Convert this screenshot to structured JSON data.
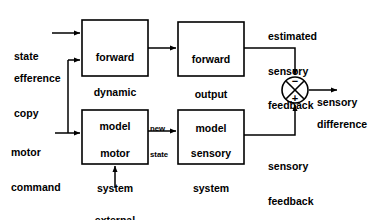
{
  "diagram": {
    "colors": {
      "line": "#000000",
      "text": "#000000",
      "background": "#ffffff"
    },
    "boxes": [
      {
        "id": "forward-dynamic-model",
        "lines": [
          "forward",
          "dynamic",
          "model"
        ],
        "x": 82,
        "y": 20,
        "w": 66,
        "h": 56
      },
      {
        "id": "forward-output-model",
        "lines": [
          "forward",
          "output",
          "model"
        ],
        "x": 178,
        "y": 22,
        "w": 66,
        "h": 54
      },
      {
        "id": "motor-system",
        "lines": [
          "motor",
          "system"
        ],
        "x": 82,
        "y": 110,
        "w": 66,
        "h": 54
      },
      {
        "id": "sensory-system",
        "lines": [
          "sensory",
          "system"
        ],
        "x": 178,
        "y": 110,
        "w": 66,
        "h": 54
      }
    ],
    "labels": [
      {
        "id": "state",
        "lines": [
          "state"
        ],
        "x": 14,
        "y": 28
      },
      {
        "id": "efference-copy",
        "lines": [
          "efference",
          "copy"
        ],
        "x": 14,
        "y": 50
      },
      {
        "id": "motor-command",
        "lines": [
          "motor",
          "command"
        ],
        "x": 11,
        "y": 124
      },
      {
        "id": "new-state",
        "lines": [
          "new",
          "state"
        ],
        "x": 150,
        "y": 108
      },
      {
        "id": "estimated-sensory-feedback",
        "lines": [
          "estimated",
          "sensory",
          "feedback"
        ],
        "x": 268,
        "y": 8
      },
      {
        "id": "sensory-feedback",
        "lines": [
          "sensory",
          "feedback"
        ],
        "x": 268,
        "y": 138
      },
      {
        "id": "sensory-word",
        "lines": [
          "sensory"
        ],
        "x": 317,
        "y": 74
      },
      {
        "id": "difference-word",
        "lines": [
          "difference"
        ],
        "x": 317,
        "y": 96
      },
      {
        "id": "external-influences",
        "lines": [
          "external",
          "influences"
        ],
        "x": 86,
        "y": 192
      }
    ],
    "junction": {
      "id": "summing-junction",
      "cx": 295,
      "cy": 90,
      "r": 13,
      "minus_sign": "−",
      "plus_sign": "+",
      "minus_pos": {
        "x": 295,
        "y": 82
      },
      "plus_pos": {
        "x": 295,
        "y": 99
      }
    },
    "connections": [
      {
        "id": "state-to-forward-dynamic-model",
        "from": "state",
        "to": "forward-dynamic-model"
      },
      {
        "id": "efference-copy-to-forward-dynamic-model",
        "from": "efference copy",
        "to": "forward-dynamic-model"
      },
      {
        "id": "forward-dynamic-model-to-forward-output-model",
        "from": "forward-dynamic-model",
        "to": "forward-output-model"
      },
      {
        "id": "forward-output-model-to-junction",
        "from": "forward-output-model",
        "to": "summing-junction",
        "sign": "−"
      },
      {
        "id": "motor-command-to-motor-system",
        "from": "motor command",
        "to": "motor-system"
      },
      {
        "id": "motor-command-branch-to-efference-copy",
        "from": "motor command",
        "to": "efference copy line"
      },
      {
        "id": "motor-system-to-sensory-system",
        "from": "motor-system",
        "to": "sensory-system",
        "label": "new state"
      },
      {
        "id": "sensory-system-to-junction",
        "from": "sensory-system",
        "to": "summing-junction",
        "sign": "+"
      },
      {
        "id": "external-influences-to-motor-system",
        "from": "external influences",
        "to": "motor-system"
      },
      {
        "id": "junction-to-sensory-difference",
        "from": "summing-junction",
        "to": "sensory difference"
      }
    ]
  }
}
